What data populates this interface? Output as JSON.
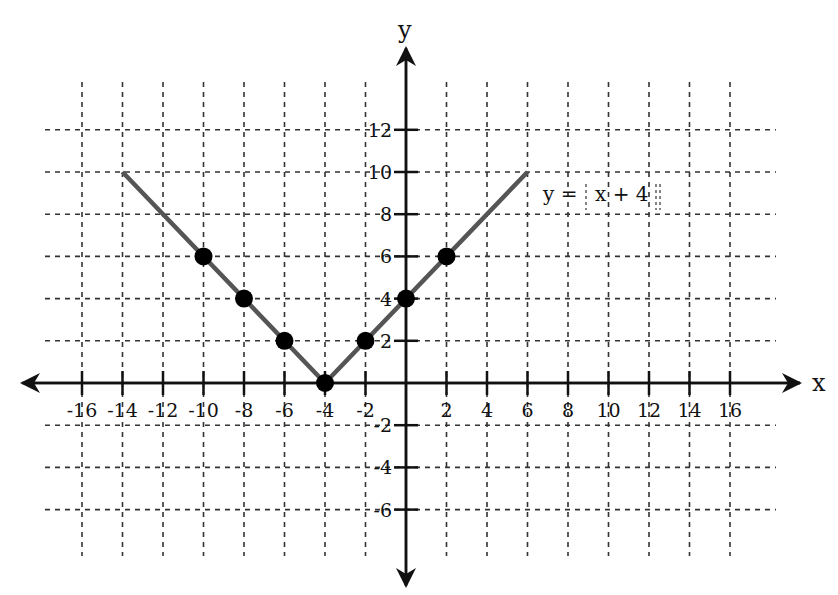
{
  "chart_data": {
    "type": "line",
    "title": "",
    "xlabel": "x",
    "ylabel": "y",
    "xlim": [
      -16,
      16
    ],
    "ylim": [
      -6,
      12
    ],
    "grid": true,
    "x_ticks": [
      -16,
      -14,
      -12,
      -10,
      -8,
      -6,
      -4,
      -2,
      2,
      4,
      6,
      8,
      10,
      12,
      14,
      16
    ],
    "y_ticks": [
      12,
      10,
      8,
      6,
      4,
      2,
      -2,
      -4,
      -6
    ],
    "series": [
      {
        "name": "y = |x + 4|",
        "kind": "line",
        "color": "#555555",
        "x": [
          -14,
          -4,
          6
        ],
        "y": [
          10,
          0,
          10
        ]
      },
      {
        "name": "points",
        "kind": "scatter",
        "color": "#000000",
        "x": [
          -10,
          -8,
          -6,
          -4,
          -2,
          0,
          2
        ],
        "y": [
          6,
          4,
          2,
          0,
          2,
          4,
          6
        ]
      }
    ],
    "annotations": [
      {
        "text": "y = |x + 4|",
        "x": 7,
        "y": 9,
        "note": "absolute value bars drawn as dashed vertical lines"
      }
    ]
  },
  "labels": {
    "x_axis": "x",
    "y_axis": "y",
    "equation_prefix": "y =",
    "equation_body": "x + 4"
  }
}
